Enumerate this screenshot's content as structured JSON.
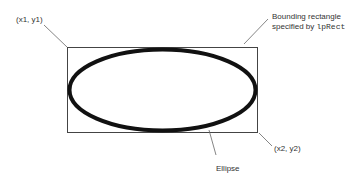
{
  "diagram": {
    "labels": {
      "top_left": "(x1, y1)",
      "bounding_line1": "Bounding rectangle",
      "bounding_line2_prefix": "specified by ",
      "bounding_line2_code": "lpRect",
      "bottom_right": "(x2, y2)",
      "ellipse": "Ellipse"
    },
    "rect": {
      "x1": 67,
      "y1": 47,
      "x2": 257,
      "y2": 132
    },
    "colors": {
      "ellipse": "#111111",
      "rect": "#444444",
      "leader": "#666666"
    }
  }
}
